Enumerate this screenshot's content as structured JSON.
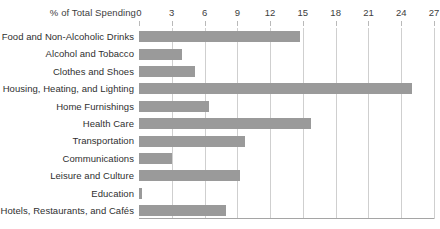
{
  "chart_data": {
    "type": "bar",
    "orientation": "horizontal",
    "title": "",
    "xlabel": "% of Total Spending",
    "ylabel": "",
    "xlim": [
      0,
      27
    ],
    "xticks": [
      0,
      3,
      6,
      9,
      12,
      15,
      18,
      21,
      24,
      27
    ],
    "grid": true,
    "legend": false,
    "bar_color": "#9a9a9a",
    "grid_color": "#cfcfcf",
    "axis_color": "#a5a5a5",
    "text_color": "#2f2f2f",
    "categories": [
      "Food and Non-Alcoholic Drinks",
      "Alcohol and Tobacco",
      "Clothes and Shoes",
      "Housing, Heating, and Lighting",
      "Home Furnishings",
      "Health Care",
      "Transportation",
      "Communications",
      "Leisure and Culture",
      "Education",
      "Hotels, Restaurants, and Cafés"
    ],
    "values": [
      14.7,
      3.9,
      5.1,
      25.0,
      6.4,
      15.7,
      9.7,
      3.0,
      9.2,
      0.3,
      8.0
    ]
  }
}
